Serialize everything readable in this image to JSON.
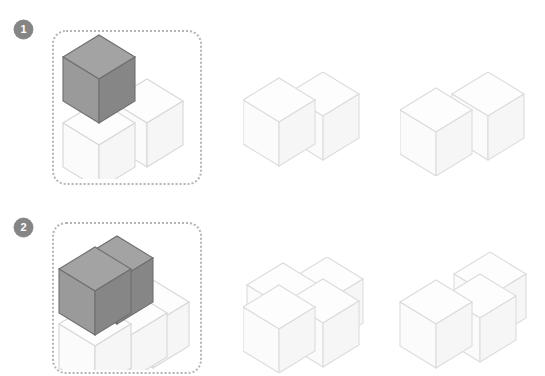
{
  "page": {
    "background_color": "#ffffff",
    "width": 545,
    "height": 376
  },
  "colors": {
    "badge_fill": "#858585",
    "badge_text": "#ffffff",
    "dotted_border": "#b4b4b4",
    "white_cube_stroke": "#d8d8d8",
    "white_cube_top": "#fdfdfd",
    "white_cube_left": "#fbfbfb",
    "white_cube_right": "#f6f6f6",
    "gray_cube_stroke": "#6f6f6f",
    "gray_cube_top": "#a3a3a3",
    "gray_cube_left": "#9a9a9a",
    "gray_cube_right": "#868686"
  },
  "rows": [
    {
      "id": "row-1",
      "badge_label": "1",
      "prompt": {
        "name": "prompt-figure-1",
        "description": "Two white cubes side by side with one gray cube stacked on the left cube",
        "white_cube_count": 2,
        "gray_cube_count": 1
      },
      "options": [
        {
          "id": "option-1a",
          "label": "A",
          "description": "Two white cubes joined side by side in a straight row",
          "cube_count": 2
        },
        {
          "id": "option-1b",
          "label": "B",
          "description": "Two white cubes offset diagonally in depth",
          "cube_count": 2
        }
      ]
    },
    {
      "id": "row-2",
      "badge_label": "2",
      "prompt": {
        "name": "prompt-figure-2",
        "description": "Base layer of white cubes with two gray cubes stacked on top left",
        "white_cube_count": 3,
        "gray_cube_count": 2
      },
      "options": [
        {
          "id": "option-2a",
          "label": "A",
          "description": "Four white cubes in a two by two block",
          "cube_count": 4
        },
        {
          "id": "option-2b",
          "label": "B",
          "description": "Three white cubes, two in front row and one offset behind",
          "cube_count": 3
        }
      ]
    }
  ]
}
